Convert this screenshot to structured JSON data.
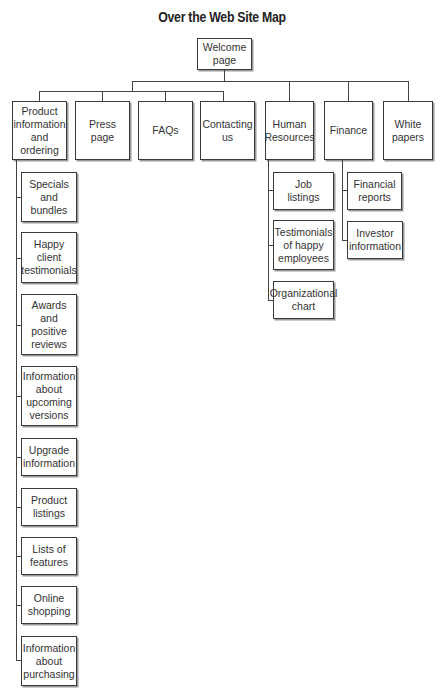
{
  "title": "Over the Web Site Map",
  "root": {
    "label": "Welcome\npage"
  },
  "sections": [
    {
      "label": "Product\ninformation\nand\nordering",
      "children": [
        "Specials\nand\nbundles",
        "Happy\nclient\ntestimonials",
        "Awards\nand\npositive\nreviews",
        "Information\nabout\nupcoming\nversions",
        "Upgrade\ninformation",
        "Product\nlistings",
        "Lists of\nfeatures",
        "Online\nshopping",
        "Information\nabout\npurchasing"
      ]
    },
    {
      "label": "Press\npage",
      "children": []
    },
    {
      "label": "FAQs",
      "children": []
    },
    {
      "label": "Contacting\nus",
      "children": []
    },
    {
      "label": "Human\nResources",
      "children": [
        "Job\nlistings",
        "Testimonials\nof happy\nemployees",
        "Organizational\nchart"
      ]
    },
    {
      "label": "Finance",
      "children": [
        "Financial\nreports",
        "Investor\ninformation"
      ]
    },
    {
      "label": "White\npapers",
      "children": []
    }
  ]
}
